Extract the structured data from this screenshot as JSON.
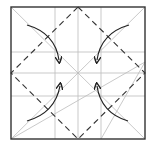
{
  "diagram": {
    "type": "origami-fold-diagram",
    "colors": {
      "border": "#333333",
      "crease": "#bbbbbb",
      "fold_line": "#333333",
      "arrow": "#222222"
    },
    "square": {
      "x": 11,
      "y": 7,
      "size": 134
    },
    "grid_x": [
      55,
      78,
      101
    ],
    "grid_y": [
      52,
      73,
      96
    ],
    "arrows": [
      {
        "name": "top-left-arrow",
        "from": "top-left corner",
        "to": "center"
      },
      {
        "name": "top-right-arrow",
        "from": "top-right corner",
        "to": "center"
      },
      {
        "name": "bottom-left-arrow",
        "from": "bottom-left corner",
        "to": "center"
      },
      {
        "name": "bottom-right-arrow",
        "from": "bottom-right corner",
        "to": "center"
      }
    ]
  }
}
